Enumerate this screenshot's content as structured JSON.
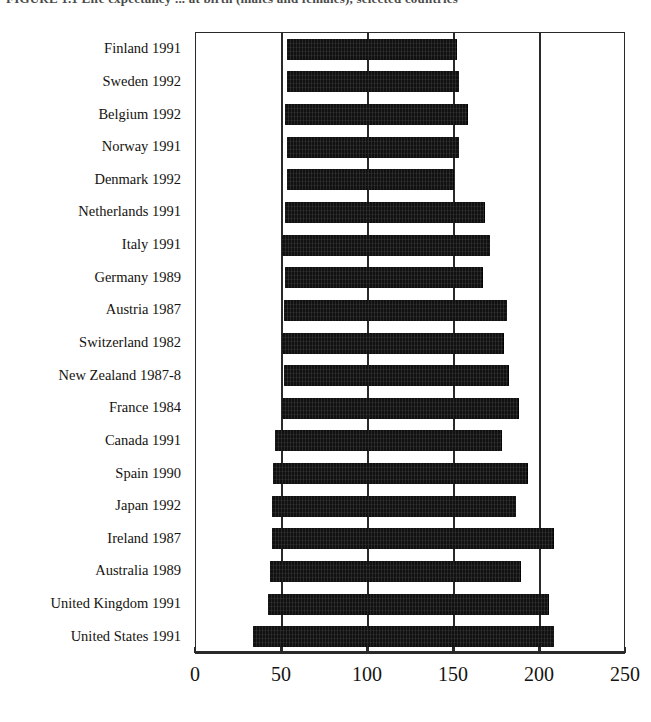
{
  "figure": {
    "title_partial": "FIGURE 1.1   Life expectancy ... at birth (males and females), selected countries",
    "background_color": "#ffffff",
    "bar_color": "#111111",
    "axis_color": "#2a2a2a"
  },
  "chart_data": {
    "type": "bar",
    "orientation": "horizontal",
    "subtype": "floating-range-bar",
    "title": "",
    "xlabel": "",
    "ylabel": "",
    "xlim": [
      0,
      250
    ],
    "ylim": null,
    "grid": true,
    "gridlines_x": [
      50,
      100,
      150,
      200
    ],
    "legend": null,
    "legend_position": "none",
    "xticks": [
      0,
      50,
      100,
      150,
      200,
      250
    ],
    "xticklabels": [
      "0",
      "50",
      "100",
      "150",
      "200",
      "250"
    ],
    "categories": [
      "Finland 1991",
      "Sweden 1992",
      "Belgium 1992",
      "Norway 1991",
      "Denmark 1992",
      "Netherlands 1991",
      "Italy 1991",
      "Germany 1989",
      "Austria 1987",
      "Switzerland 1982",
      "New Zealand 1987-8",
      "France 1984",
      "Canada 1991",
      "Spain 1990",
      "Japan 1992",
      "Ireland 1987",
      "Australia 1989",
      "United Kingdom 1991",
      "United States 1991"
    ],
    "bars": [
      {
        "label": "Finland 1991",
        "start": 53,
        "end": 152,
        "length": 99
      },
      {
        "label": "Sweden 1992",
        "start": 53,
        "end": 153,
        "length": 100
      },
      {
        "label": "Belgium 1992",
        "start": 52,
        "end": 158,
        "length": 106
      },
      {
        "label": "Norway 1991",
        "start": 53,
        "end": 153,
        "length": 100
      },
      {
        "label": "Denmark 1992",
        "start": 53,
        "end": 150,
        "length": 97
      },
      {
        "label": "Netherlands 1991",
        "start": 52,
        "end": 168,
        "length": 116
      },
      {
        "label": "Italy 1991",
        "start": 50,
        "end": 171,
        "length": 121
      },
      {
        "label": "Germany 1989",
        "start": 52,
        "end": 167,
        "length": 115
      },
      {
        "label": "Austria 1987",
        "start": 51,
        "end": 181,
        "length": 130
      },
      {
        "label": "Switzerland 1982",
        "start": 50,
        "end": 179,
        "length": 129
      },
      {
        "label": "New Zealand 1987-8",
        "start": 51,
        "end": 182,
        "length": 131
      },
      {
        "label": "France 1984",
        "start": 50,
        "end": 188,
        "length": 138
      },
      {
        "label": "Canada 1991",
        "start": 46,
        "end": 178,
        "length": 132
      },
      {
        "label": "Spain 1990",
        "start": 45,
        "end": 193,
        "length": 148
      },
      {
        "label": "Japan 1992",
        "start": 44,
        "end": 186,
        "length": 142
      },
      {
        "label": "Ireland 1987",
        "start": 44,
        "end": 208,
        "length": 164
      },
      {
        "label": "Australia 1989",
        "start": 43,
        "end": 189,
        "length": 146
      },
      {
        "label": "United Kingdom 1991",
        "start": 42,
        "end": 205,
        "length": 163
      },
      {
        "label": "United States 1991",
        "start": 33,
        "end": 208,
        "length": 175
      }
    ]
  }
}
